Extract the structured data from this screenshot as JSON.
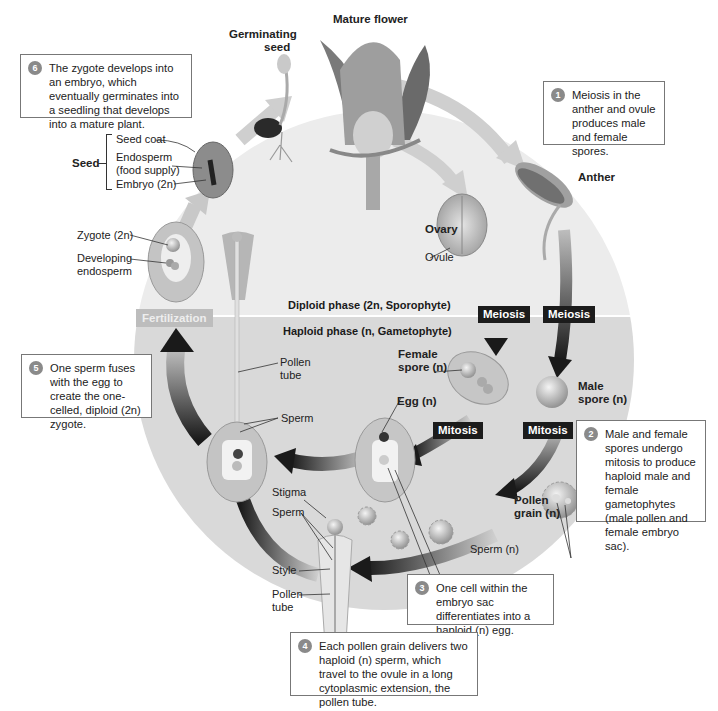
{
  "diagram": {
    "type": "cycle",
    "colors": {
      "diploid_bg": "#e8e8e8",
      "haploid_bg": "#d6d6d6",
      "tag_bg": "#1c1c1c",
      "fertilization_bg": "#bdbdbd",
      "badge": "#8a8a8a"
    }
  },
  "phases": {
    "diploid": "Diploid phase (2n, Sporophyte)",
    "haploid": "Haploid phase (n, Gametophyte)"
  },
  "process_tags": {
    "meiosis_1": "Meiosis",
    "meiosis_2": "Meiosis",
    "mitosis_1": "Mitosis",
    "mitosis_2": "Mitosis",
    "fertilization": "Fertilization"
  },
  "structures": {
    "mature_flower": "Mature flower",
    "germinating_seed_line1": "Germinating",
    "germinating_seed_line2": "seed",
    "anther": "Anther",
    "ovary": "Ovary",
    "ovule": "Ovule",
    "seed": "Seed",
    "seed_coat": "Seed coat",
    "endosperm_line1": "Endosperm",
    "endosperm_line2": "(food supply)",
    "embryo": "Embryo (2n)",
    "zygote": "Zygote (2n)",
    "developing_endosperm_line1": "Developing",
    "developing_endosperm_line2": "endosperm",
    "pollen_tube_1_line1": "Pollen",
    "pollen_tube_1_line2": "tube",
    "sperm_1": "Sperm",
    "female_spore_line1": "Female",
    "female_spore_line2": "spore (n)",
    "male_spore_line1": "Male",
    "male_spore_line2": "spore (n)",
    "egg": "Egg (n)",
    "pollen_grain_line1": "Pollen",
    "pollen_grain_line2": "grain (n)",
    "sperm_n": "Sperm (n)",
    "stigma": "Stigma",
    "sperm_2": "Sperm",
    "style": "Style",
    "pollen_tube_2_line1": "Pollen",
    "pollen_tube_2_line2": "tube"
  },
  "callouts": [
    {
      "num": "1",
      "text": "Meiosis in the anther and ovule produces male and female spores."
    },
    {
      "num": "2",
      "text": "Male and female spores undergo mitosis to produce haploid male and female gametophytes (male pollen and female embryo sac)."
    },
    {
      "num": "3",
      "text": "One cell within the embryo sac differentiates into a haploid (n) egg."
    },
    {
      "num": "4",
      "text": "Each pollen grain delivers two haploid (n) sperm, which travel to the ovule in a long cytoplasmic extension, the pollen tube."
    },
    {
      "num": "5",
      "text": "One sperm fuses with the egg to create the one-celled, diploid (2n) zygote."
    },
    {
      "num": "6",
      "text": "The zygote develops into an embryo, which eventually germinates into a seedling that develops into a mature plant."
    }
  ]
}
